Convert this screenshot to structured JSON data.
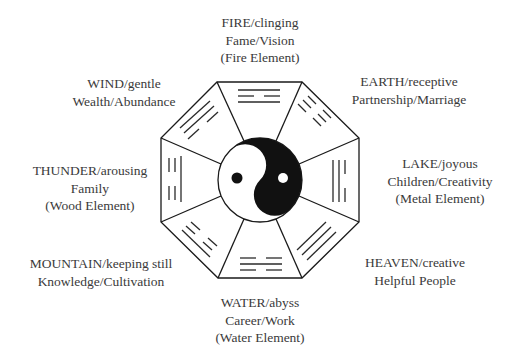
{
  "diagram": {
    "type": "bagua-octagon",
    "center": "yin-yang",
    "stroke_color": "#1a1a1a",
    "text_color": "#3a3a3a"
  },
  "labels": {
    "fire": {
      "line1": "FIRE/clinging",
      "line2": "Fame/Vision",
      "line3": "(Fire Element)"
    },
    "earth": {
      "line1": "EARTH/receptive",
      "line2": "Partnership/Marriage"
    },
    "lake": {
      "line1": "LAKE/joyous",
      "line2": "Children/Creativity",
      "line3": "(Metal Element)"
    },
    "heaven": {
      "line1": "HEAVEN/creative",
      "line2": "Helpful People"
    },
    "water": {
      "line1": "WATER/abyss",
      "line2": "Career/Work",
      "line3": "(Water Element)"
    },
    "mountain": {
      "line1": "MOUNTAIN/keeping still",
      "line2": "Knowledge/Cultivation"
    },
    "thunder": {
      "line1": "THUNDER/arousing",
      "line2": "Family",
      "line3": "(Wood Element)"
    },
    "wind": {
      "line1": "WIND/gentle",
      "line2": "Wealth/Abundance"
    }
  },
  "trigrams": {
    "fire": [
      "solid",
      "broken",
      "solid"
    ],
    "earth": [
      "broken",
      "broken",
      "broken"
    ],
    "lake": [
      "broken",
      "solid",
      "solid"
    ],
    "heaven": [
      "solid",
      "solid",
      "solid"
    ],
    "water": [
      "broken",
      "solid",
      "broken"
    ],
    "mountain": [
      "solid",
      "broken",
      "broken"
    ],
    "thunder": [
      "broken",
      "broken",
      "solid"
    ],
    "wind": [
      "solid",
      "solid",
      "broken"
    ]
  }
}
